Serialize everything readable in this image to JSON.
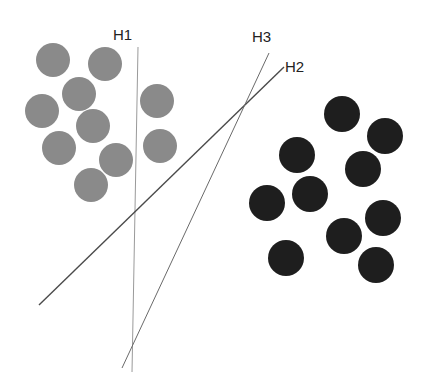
{
  "colors": {
    "background": "#ffffff",
    "class_a": "#8a8a8a",
    "class_b": "#1e1e1e",
    "h1": "#9a9a9a",
    "h2": "#4a4a4a",
    "h3": "#6a6a6a",
    "label": "#222222"
  },
  "class_a_points": [
    {
      "cx": 53,
      "cy": 60,
      "r": 17
    },
    {
      "cx": 105,
      "cy": 64,
      "r": 17
    },
    {
      "cx": 79,
      "cy": 94,
      "r": 17
    },
    {
      "cx": 42,
      "cy": 111,
      "r": 17
    },
    {
      "cx": 93,
      "cy": 126,
      "r": 17
    },
    {
      "cx": 59,
      "cy": 148,
      "r": 17
    },
    {
      "cx": 116,
      "cy": 160,
      "r": 17
    },
    {
      "cx": 91,
      "cy": 185,
      "r": 17
    },
    {
      "cx": 157,
      "cy": 101,
      "r": 17
    },
    {
      "cx": 160,
      "cy": 146,
      "r": 17
    }
  ],
  "class_b_points": [
    {
      "cx": 342,
      "cy": 114,
      "r": 18
    },
    {
      "cx": 385,
      "cy": 136,
      "r": 18
    },
    {
      "cx": 297,
      "cy": 155,
      "r": 18
    },
    {
      "cx": 363,
      "cy": 169,
      "r": 18
    },
    {
      "cx": 267,
      "cy": 203,
      "r": 18
    },
    {
      "cx": 310,
      "cy": 194,
      "r": 18
    },
    {
      "cx": 383,
      "cy": 218,
      "r": 18
    },
    {
      "cx": 344,
      "cy": 236,
      "r": 18
    },
    {
      "cx": 286,
      "cy": 258,
      "r": 18
    },
    {
      "cx": 376,
      "cy": 265,
      "r": 18
    }
  ],
  "hyperplanes": [
    {
      "id": "H1",
      "label": "H1",
      "x1": 138,
      "y1": 47,
      "x2": 132,
      "y2": 372,
      "width": 1,
      "color_key": "h1",
      "label_x": 113,
      "label_y": 27
    },
    {
      "id": "H2",
      "label": "H2",
      "x1": 284,
      "y1": 67,
      "x2": 39,
      "y2": 305,
      "width": 1.4,
      "color_key": "h2",
      "label_x": 285,
      "label_y": 59
    },
    {
      "id": "H3",
      "label": "H3",
      "x1": 269,
      "y1": 53,
      "x2": 122,
      "y2": 368,
      "width": 1,
      "color_key": "h3",
      "label_x": 252,
      "label_y": 29
    }
  ],
  "labels": {
    "h1": "H1",
    "h2": "H2",
    "h3": "H3"
  }
}
